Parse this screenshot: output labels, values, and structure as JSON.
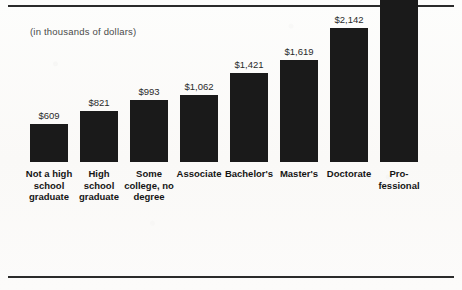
{
  "figure": {
    "subtitle": "(in thousands of dollars)",
    "currency_prefix": "$",
    "bar_color": "#1a1a1a",
    "background_color": "#fbfbf9",
    "rule_color": "#2b2b2b"
  },
  "chart_data": {
    "type": "bar",
    "title": "",
    "subtitle": "(in thousands of dollars)",
    "xlabel": "",
    "ylabel": "",
    "ylim": [
      0,
      3013
    ],
    "grid": false,
    "legend": false,
    "axis_visible": false,
    "value_labels_shown": true,
    "units": "thousands of dollars",
    "categories": [
      "Not a high school graduate",
      "High school graduate",
      "Some college, no degree",
      "Associate",
      "Bachelor's",
      "Master's",
      "Doctorate",
      "Professional"
    ],
    "values": [
      609,
      821,
      993,
      1062,
      1421,
      1619,
      2142,
      3013
    ],
    "value_labels": [
      "$609",
      "$821",
      "$993",
      "$1,062",
      "$1,421",
      "$1,619",
      "$2,142",
      "$3,013"
    ],
    "tick_labels": [
      [
        "Not a high",
        "school",
        "graduate"
      ],
      [
        "High",
        "school",
        "graduate"
      ],
      [
        "Some",
        "college, no",
        "degree"
      ],
      [
        "Associate"
      ],
      [
        "Bachelor's"
      ],
      [
        "Master's"
      ],
      [
        "Doctorate"
      ],
      [
        "Pro-",
        "fessional"
      ]
    ]
  }
}
